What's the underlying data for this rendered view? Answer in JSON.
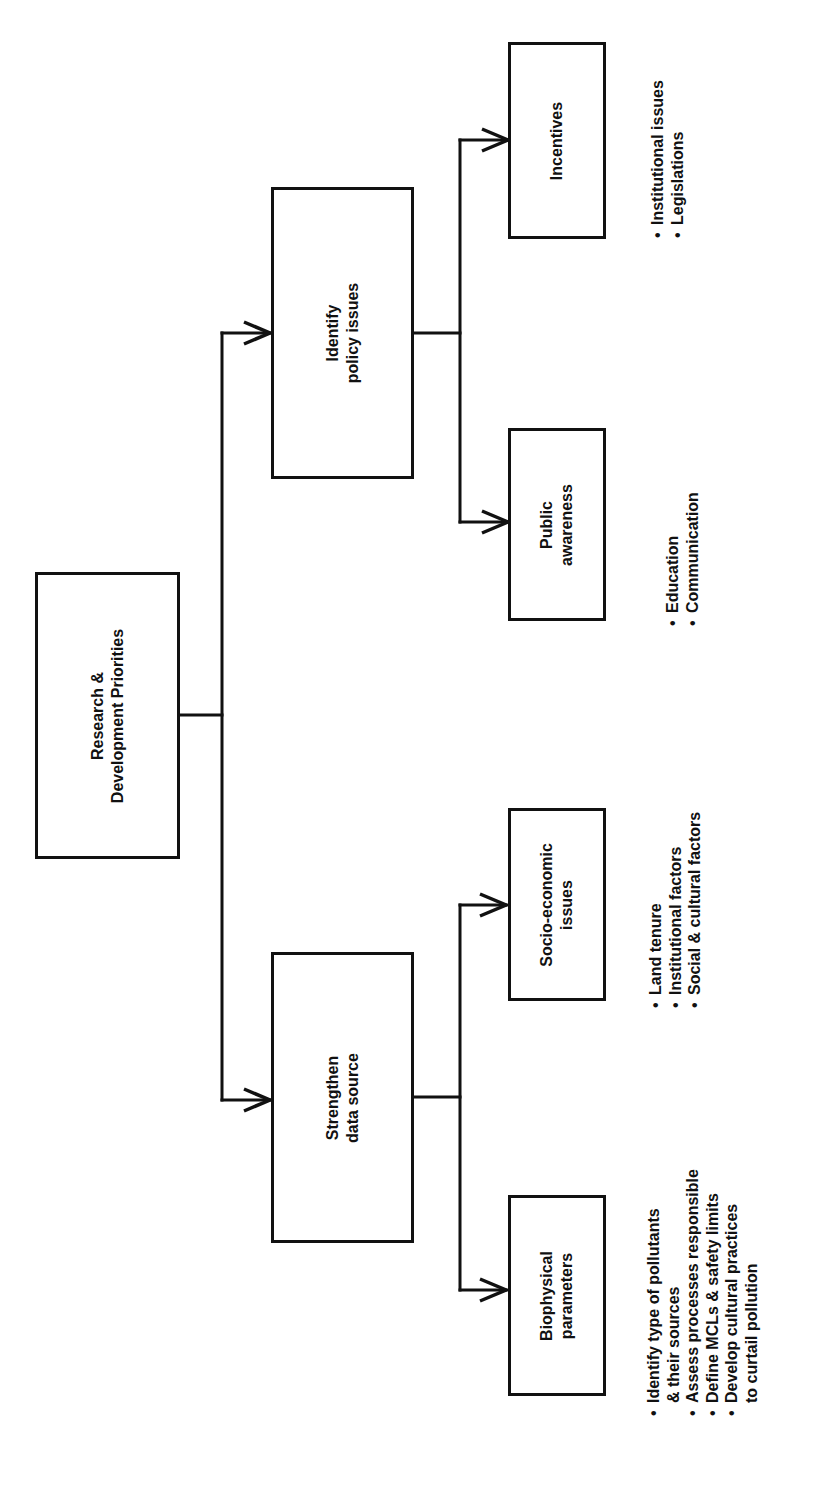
{
  "diagram": {
    "orientation": "rotated 90° counter-clockwise",
    "root": {
      "lines": [
        "Research &",
        "Development Priorities"
      ]
    },
    "branches": [
      {
        "lines": [
          "Identify",
          "policy issues"
        ],
        "children": [
          {
            "lines": [
              "Incentives"
            ],
            "bullets": [
              {
                "text": "Institutional issues"
              },
              {
                "text": "Legislations"
              }
            ]
          },
          {
            "lines": [
              "Public",
              "awareness"
            ],
            "bullets": [
              {
                "text": "Education"
              },
              {
                "text": "Communication"
              }
            ]
          }
        ]
      },
      {
        "lines": [
          "Strengthen",
          "data source"
        ],
        "children": [
          {
            "lines": [
              "Socio-economic",
              "issues"
            ],
            "bullets": [
              {
                "text": "Land tenure"
              },
              {
                "text": "Institutional factors"
              },
              {
                "text": "Social & cultural factors"
              }
            ]
          },
          {
            "lines": [
              "Biophysical",
              "parameters"
            ],
            "bullets": [
              {
                "text": "Identify type of pollutants",
                "cont": "& their sources"
              },
              {
                "text": "Assess processes responsible"
              },
              {
                "text": "Define MCLs & safety limits"
              },
              {
                "text": "Develop cultural practices",
                "cont": "to curtail pollution"
              }
            ]
          }
        ]
      }
    ]
  },
  "colors": {
    "line": "#111111",
    "background": "#ffffff"
  }
}
